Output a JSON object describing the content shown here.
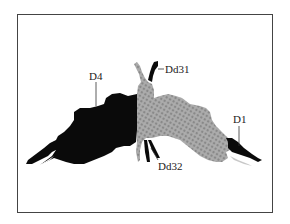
{
  "figure": {
    "type": "inkblot-location-diagram",
    "colors": {
      "frame": "#444444",
      "solid_region": "#0a0a0a",
      "stippled_region": "#a8a8a8",
      "stipple_dot": "#7a7a7a",
      "background": "#ffffff"
    },
    "labels": [
      {
        "id": "D4",
        "text": "D4"
      },
      {
        "id": "Dd31",
        "text": "Dd31"
      },
      {
        "id": "Dd32",
        "text": "Dd32"
      },
      {
        "id": "D1",
        "text": "D1"
      }
    ]
  }
}
